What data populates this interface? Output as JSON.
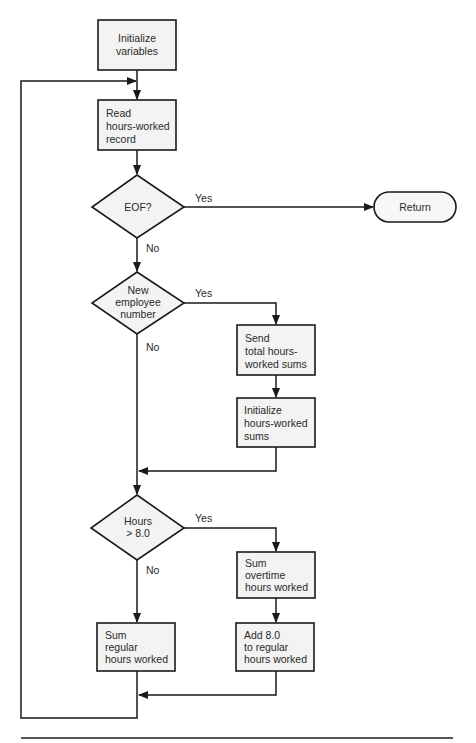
{
  "diagram": {
    "type": "flowchart",
    "colors": {
      "stroke": "#1a1a1a",
      "fill": "#f3f3f3",
      "text": "#2a2a2a",
      "rule": "#555555"
    },
    "nodes": {
      "init_vars": {
        "shape": "process",
        "lines": [
          "Initialize",
          "variables"
        ]
      },
      "read_record": {
        "shape": "process",
        "lines": [
          "Read",
          "hours-worked",
          "record"
        ]
      },
      "eof": {
        "shape": "decision",
        "lines": [
          "EOF?"
        ]
      },
      "return": {
        "shape": "terminal",
        "lines": [
          "Return"
        ]
      },
      "new_emp": {
        "shape": "decision",
        "lines": [
          "New",
          "employee",
          "number"
        ]
      },
      "send_totals": {
        "shape": "process",
        "lines": [
          "Send",
          "total hours-",
          "worked sums"
        ]
      },
      "init_sums": {
        "shape": "process",
        "lines": [
          "Initialize",
          "hours-worked",
          "sums"
        ]
      },
      "hours_gt8": {
        "shape": "decision",
        "lines": [
          "Hours",
          "> 8.0"
        ]
      },
      "sum_overtime": {
        "shape": "process",
        "lines": [
          "Sum",
          "overtime",
          "hours worked"
        ]
      },
      "add_8": {
        "shape": "process",
        "lines": [
          "Add 8.0",
          "to regular",
          "hours worked"
        ]
      },
      "sum_regular": {
        "shape": "process",
        "lines": [
          "Sum",
          "regular",
          "hours worked"
        ]
      }
    },
    "edge_labels": {
      "eof_yes": "Yes",
      "eof_no": "No",
      "new_emp_yes": "Yes",
      "new_emp_no": "No",
      "hours_yes": "Yes",
      "hours_no": "No"
    },
    "edges": [
      {
        "from": "init_vars",
        "to": "read_record"
      },
      {
        "from": "read_record",
        "to": "eof"
      },
      {
        "from": "eof",
        "to": "return",
        "label": "Yes"
      },
      {
        "from": "eof",
        "to": "new_emp",
        "label": "No"
      },
      {
        "from": "new_emp",
        "to": "send_totals",
        "label": "Yes"
      },
      {
        "from": "send_totals",
        "to": "init_sums"
      },
      {
        "from": "init_sums",
        "to": "merge_1"
      },
      {
        "from": "new_emp",
        "to": "merge_1",
        "label": "No"
      },
      {
        "from": "merge_1",
        "to": "hours_gt8"
      },
      {
        "from": "hours_gt8",
        "to": "sum_overtime",
        "label": "Yes"
      },
      {
        "from": "sum_overtime",
        "to": "add_8"
      },
      {
        "from": "add_8",
        "to": "merge_2"
      },
      {
        "from": "hours_gt8",
        "to": "sum_regular",
        "label": "No"
      },
      {
        "from": "sum_regular",
        "to": "merge_2"
      },
      {
        "from": "merge_2",
        "to": "read_record",
        "note": "loop back"
      }
    ]
  }
}
